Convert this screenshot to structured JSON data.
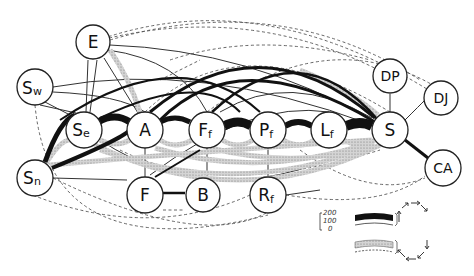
{
  "diagram": {
    "type": "network-flow",
    "colors": {
      "strong": "#111111",
      "shaded": "#b8b8b8",
      "thin": "#333333",
      "dashed": "#444444",
      "background": "#ffffff"
    },
    "nodes": [
      {
        "id": "Sw",
        "label": "S",
        "sub": "w",
        "x": 35,
        "y": 87
      },
      {
        "id": "E",
        "label": "E",
        "sub": "",
        "x": 93,
        "y": 42
      },
      {
        "id": "Se",
        "label": "S",
        "sub": "e",
        "x": 84,
        "y": 130
      },
      {
        "id": "A",
        "label": "A",
        "sub": "",
        "x": 145,
        "y": 130
      },
      {
        "id": "Ff",
        "label": "F",
        "sub": "f",
        "x": 207,
        "y": 130
      },
      {
        "id": "Pf",
        "label": "P",
        "sub": "f",
        "x": 268,
        "y": 130
      },
      {
        "id": "Lf",
        "label": "L",
        "sub": "f",
        "x": 329,
        "y": 130
      },
      {
        "id": "S",
        "label": "S",
        "sub": "",
        "x": 390,
        "y": 130
      },
      {
        "id": "DP",
        "label": "DP",
        "sub": "",
        "x": 390,
        "y": 76
      },
      {
        "id": "DJ",
        "label": "DJ",
        "sub": "",
        "x": 441,
        "y": 98
      },
      {
        "id": "CA",
        "label": "CA",
        "sub": "",
        "x": 443,
        "y": 168
      },
      {
        "id": "Sn",
        "label": "S",
        "sub": "n",
        "x": 35,
        "y": 178
      },
      {
        "id": "F",
        "label": "F",
        "sub": "",
        "x": 145,
        "y": 195
      },
      {
        "id": "B",
        "label": "B",
        "sub": "",
        "x": 203,
        "y": 195
      },
      {
        "id": "Rf",
        "label": "R",
        "sub": "f",
        "x": 268,
        "y": 195
      }
    ],
    "legend": {
      "scale_ticks": [
        "200",
        "100",
        "0"
      ],
      "forward_label": "forward flow (black band)",
      "reverse_label": "reverse flow (stippled band)"
    }
  }
}
